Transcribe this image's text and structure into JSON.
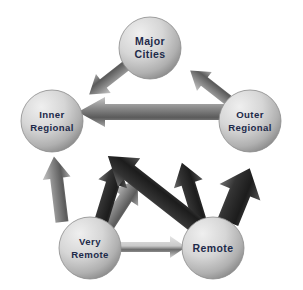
{
  "diagram": {
    "type": "pentagon-flow",
    "background_color": "#ffffff",
    "node_text_color": "#1d2a4a",
    "node_fill_light": "#e3e3e3",
    "node_fill_dark": "#9a9a9a",
    "arrow_light": "#b8b8b8",
    "arrow_mid": "#7d7d7d",
    "arrow_dark": "#2b2b2b",
    "nodes": [
      {
        "id": "major-cities",
        "label_line1": "Major",
        "label_line2": "Cities",
        "cx": 150,
        "cy": 48,
        "r": 31
      },
      {
        "id": "inner-regional",
        "label_line1": "Inner",
        "label_line2": "Regional",
        "cx": 52,
        "cy": 121,
        "r": 31
      },
      {
        "id": "outer-regional",
        "label_line1": "Outer",
        "label_line2": "Regional",
        "cx": 250,
        "cy": 121,
        "r": 31
      },
      {
        "id": "very-remote",
        "label_line1": "Very",
        "label_line2": "Remote",
        "cx": 90,
        "cy": 248,
        "r": 31
      },
      {
        "id": "remote",
        "label_line1": "Remote",
        "label_line2": "",
        "cx": 213,
        "cy": 248,
        "r": 31
      }
    ],
    "arrows": [
      {
        "id": "major-cities-to-inner-regional",
        "from": "major-cities",
        "to": "inner-regional",
        "shade": "mid"
      },
      {
        "id": "outer-regional-to-major-cities",
        "from": "outer-regional",
        "to": "major-cities",
        "shade": "mid"
      },
      {
        "id": "outer-regional-to-inner-regional",
        "from": "outer-regional",
        "to": "inner-regional",
        "shade": "dark"
      },
      {
        "id": "very-remote-to-major-cities",
        "from": "very-remote",
        "to": "major-cities",
        "shade": "dark"
      },
      {
        "id": "remote-to-major-cities",
        "from": "remote",
        "to": "major-cities",
        "shade": "dark"
      },
      {
        "id": "remote-to-inner-regional",
        "from": "remote",
        "to": "inner-regional",
        "shade": "dark"
      },
      {
        "id": "very-remote-to-outer-regional",
        "from": "very-remote",
        "to": "outer-regional",
        "shade": "mid"
      },
      {
        "id": "remote-to-outer-regional",
        "from": "remote",
        "to": "outer-regional",
        "shade": "dark"
      },
      {
        "id": "very-remote-to-inner-regional",
        "from": "very-remote",
        "to": "inner-regional",
        "shade": "mid"
      },
      {
        "id": "very-remote-to-remote",
        "from": "very-remote",
        "to": "remote",
        "shade": "light"
      }
    ]
  }
}
